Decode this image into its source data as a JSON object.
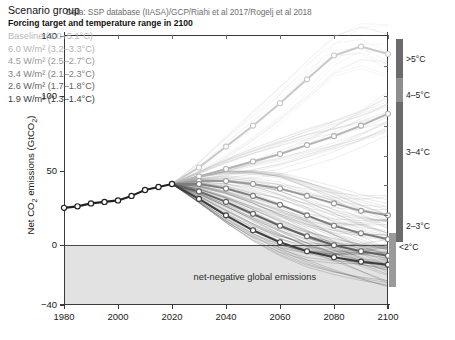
{
  "attribution": "Data: SSP database (IIASA)/GCP/Riahi et al 2017/Rogelj et al 2018",
  "axes": {
    "ylabel_pre": "Net CO",
    "ylabel_sub": "2",
    "ylabel_post": " emissions (GtCO",
    "ylabel_sub2": "2",
    "ylabel_end": ")"
  },
  "legend": {
    "title": "Scenario group",
    "subtitle": "Forcing target and temperature range in 2100",
    "items": [
      {
        "label": "Baseline (3.0–5.1°C)",
        "color": "#c9c9c9",
        "forcing": "Baseline",
        "temp_range": "3.0–5.1°C"
      },
      {
        "label": "6.0 W/m² (3.2–3.3°C)",
        "color": "#b3b3b3",
        "forcing": "6.0 W/m2",
        "temp_range": "3.2–3.3°C"
      },
      {
        "label": "4.5 W/m² (2.5–2.7°C)",
        "color": "#9a9a9a",
        "forcing": "4.5 W/m2",
        "temp_range": "2.5–2.7°C"
      },
      {
        "label": "3.4 W/m² (2.1–2.3°C)",
        "color": "#7d7d7d",
        "forcing": "3.4 W/m2",
        "temp_range": "2.1–2.3°C"
      },
      {
        "label": "2.6 W/m² (1.7–1.8°C)",
        "color": "#616161",
        "forcing": "2.6 W/m2",
        "temp_range": "1.7–1.8°C"
      },
      {
        "label": "1.9 W/m² (1.3–1.4°C)",
        "color": "#3d3d3d",
        "forcing": "1.9 W/m2",
        "temp_range": "1.3–1.4°C"
      }
    ]
  },
  "annotations": {
    "net_negative": "net-negative global emissions"
  },
  "temperature_bars": [
    {
      "label": ">5°C",
      "top_value": 138,
      "bottom_value": 112,
      "color": "#6b6b6b",
      "label_value": 124
    },
    {
      "label": "4–5°C",
      "top_value": 112,
      "bottom_value": 96,
      "color": "#8f8f8f",
      "label_value": 100
    },
    {
      "label": "3–4°C",
      "top_value": 96,
      "bottom_value": 34,
      "color": "#6b6b6b",
      "label_value": 62
    },
    {
      "label": "2–3°C",
      "top_value": 34,
      "bottom_value": 2,
      "color": "#6b6b6b",
      "label_value": 12
    },
    {
      "label": "<2°C",
      "top_value": 8,
      "bottom_value": -28,
      "color": "#9a9a9a",
      "label_value": -2
    }
  ],
  "chart_data": {
    "type": "line",
    "xlabel": "",
    "ylabel": "Net CO2 emissions (GtCO2)",
    "xlim": [
      1980,
      2100
    ],
    "ylim": [
      -40,
      140
    ],
    "xticks": [
      1980,
      2000,
      2020,
      2040,
      2060,
      2080,
      2100
    ],
    "yticks": [
      -40,
      0,
      50,
      100,
      140
    ],
    "grid": false,
    "legend_position": "upper-left-inside",
    "x": [
      1980,
      1990,
      2000,
      2005,
      2010,
      2015,
      2020,
      2030,
      2040,
      2050,
      2060,
      2070,
      2080,
      2090,
      2100
    ],
    "historical": {
      "name": "Historical",
      "color": "#222222",
      "x": [
        1980,
        1985,
        1990,
        1995,
        2000,
        2005,
        2010,
        2015,
        2020
      ],
      "values": [
        25,
        26,
        28,
        29,
        30,
        33,
        37,
        39,
        41
      ]
    },
    "series": [
      {
        "name": "Baseline (3.0-5.1°C)",
        "color": "#c9c9c9",
        "x": [
          2020,
          2030,
          2040,
          2050,
          2060,
          2070,
          2080,
          2090,
          2100
        ],
        "values": [
          41,
          52,
          66,
          80,
          95,
          111,
          127,
          133,
          128
        ]
      },
      {
        "name": "6.0 W/m2 (3.2-3.3°C)",
        "color": "#b3b3b3",
        "x": [
          2020,
          2030,
          2040,
          2050,
          2060,
          2070,
          2080,
          2090,
          2100
        ],
        "values": [
          41,
          46,
          51,
          56,
          61,
          67,
          73,
          80,
          88
        ]
      },
      {
        "name": "4.5 W/m2 (2.5-2.7°C)",
        "color": "#9a9a9a",
        "x": [
          2020,
          2030,
          2040,
          2050,
          2060,
          2070,
          2080,
          2090,
          2100
        ],
        "values": [
          41,
          43,
          43,
          41,
          38,
          33,
          28,
          23,
          20
        ]
      },
      {
        "name": "3.4 W/m2 (2.1-2.3°C)",
        "color": "#7d7d7d",
        "x": [
          2020,
          2030,
          2040,
          2050,
          2060,
          2070,
          2080,
          2090,
          2100
        ],
        "values": [
          41,
          41,
          38,
          33,
          27,
          20,
          13,
          8,
          4
        ]
      },
      {
        "name": "2.6 W/m2 (1.7-1.8°C)",
        "color": "#616161",
        "x": [
          2020,
          2030,
          2040,
          2050,
          2060,
          2070,
          2080,
          2090,
          2100
        ],
        "values": [
          41,
          36,
          29,
          21,
          13,
          6,
          0,
          -4,
          -7
        ]
      },
      {
        "name": "1.9 W/m2 (1.3-1.4°C)",
        "color": "#3d3d3d",
        "x": [
          2020,
          2030,
          2040,
          2050,
          2060,
          2070,
          2080,
          2090,
          2100
        ],
        "values": [
          41,
          31,
          20,
          10,
          2,
          -4,
          -8,
          -11,
          -13
        ]
      }
    ],
    "annotations": [
      {
        "text": "net-negative global emissions",
        "x": 2040,
        "y": -22
      },
      {
        "text": "Data: SSP database (IIASA)/GCP/Riahi et al 2017/Rogelj et al 2018",
        "x": 1984,
        "y": 145
      }
    ]
  }
}
